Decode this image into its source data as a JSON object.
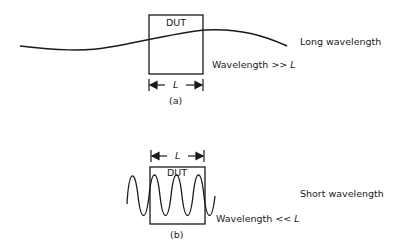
{
  "panel_a": {
    "box_label": "DUT",
    "wave_label": "Long wavelength",
    "relation_prefix": "Wavelength >> ",
    "relation_var": "L",
    "dimension_label": "L",
    "caption": "(a)"
  },
  "panel_b": {
    "box_label": "DUT",
    "wave_label": "Short wavelength",
    "relation_prefix": "Wavelength << ",
    "relation_var": "L",
    "dimension_label": "L",
    "caption": "(b)"
  },
  "colors": {
    "stroke": "#1a1a1a",
    "background": "#ffffff"
  }
}
